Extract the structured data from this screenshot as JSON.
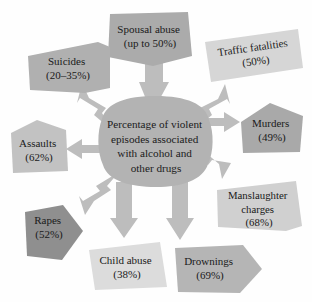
{
  "diagram": {
    "type": "radial-concept-map",
    "background_color": "#fefefe",
    "center": {
      "label_lines": [
        "Percentage of violent",
        "episodes associated",
        "with alcohol and",
        "other drugs"
      ],
      "full_text": "Percentage of violent episodes associated with alcohol and other drugs",
      "fill_color": "#b3b3b3",
      "text_color": "#1b1b1b"
    },
    "arrow_color": "#bdbdbd",
    "nodes": [
      {
        "id": "spousal-abuse",
        "label_lines": [
          "Spousal abuse",
          "(up to 50%)"
        ],
        "title": "Spousal abuse",
        "value": "(up to 50%)",
        "fill_color": "#ababab",
        "direction": "up"
      },
      {
        "id": "traffic-fatalities",
        "label_lines": [
          "Traffic fatalities",
          "(50%)"
        ],
        "title": "Traffic fatalities",
        "value": "(50%)",
        "fill_color": "#d6d6d6",
        "direction": "up-right"
      },
      {
        "id": "suicides",
        "label_lines": [
          "Suicides",
          "(20–35%)"
        ],
        "title": "Suicides",
        "value": "(20–35%)",
        "fill_color": "#b0b0b0",
        "direction": "up-left"
      },
      {
        "id": "murders",
        "label_lines": [
          "Murders",
          "(49%)"
        ],
        "title": "Murders",
        "value": "(49%)",
        "fill_color": "#a9a9a9",
        "direction": "right"
      },
      {
        "id": "assaults",
        "label_lines": [
          "Assaults",
          "(62%)"
        ],
        "title": "Assaults",
        "value": "(62%)",
        "fill_color": "#c2c2c2",
        "direction": "left"
      },
      {
        "id": "manslaughter-charges",
        "label_lines": [
          "Manslaughter",
          "charges",
          "(68%)"
        ],
        "title": "Manslaughter charges",
        "value": "(68%)",
        "fill_color": "#d0d0d0",
        "direction": "down-right"
      },
      {
        "id": "rapes",
        "label_lines": [
          "Rapes",
          "(52%)"
        ],
        "title": "Rapes",
        "value": "(52%)",
        "fill_color": "#8f8f8f",
        "direction": "down-left"
      },
      {
        "id": "child-abuse",
        "label_lines": [
          "Child abuse",
          "(38%)"
        ],
        "title": "Child abuse",
        "value": "(38%)",
        "fill_color": "#dcdcdc",
        "direction": "down"
      },
      {
        "id": "drownings",
        "label_lines": [
          "Drownings",
          "(69%)"
        ],
        "title": "Drownings",
        "value": "(69%)",
        "fill_color": "#b5b5b5",
        "direction": "down-right-2"
      }
    ]
  }
}
